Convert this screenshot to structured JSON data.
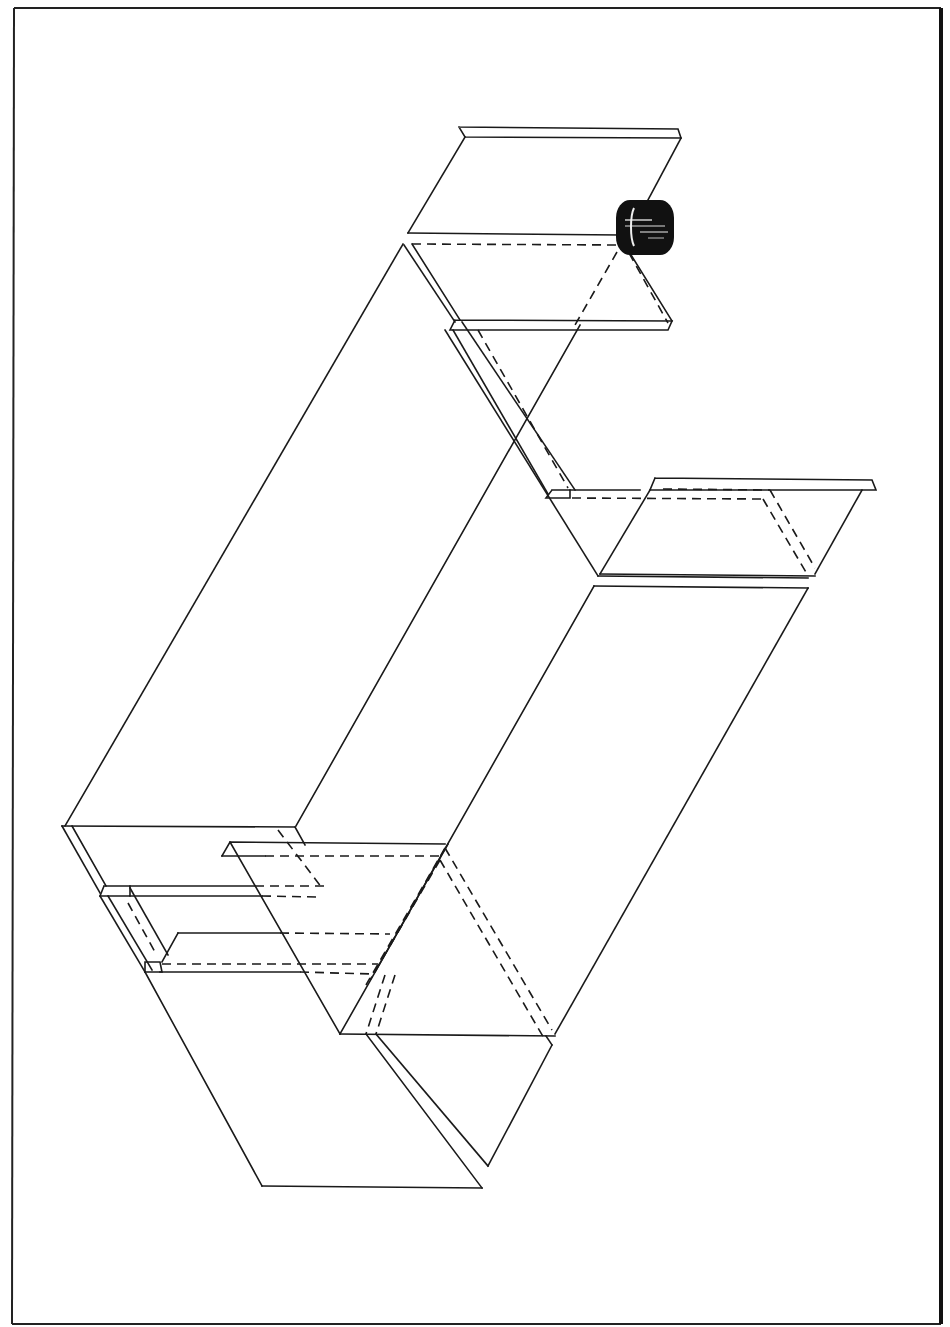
{
  "figure": {
    "type": "isometric exploded line drawing",
    "caption": "",
    "colors": {
      "line": "#1a1a1a",
      "background": "#ffffff",
      "fitting": "#111111"
    },
    "components": [
      {
        "id": "top-flanged-panel",
        "label": "Top flanged panel"
      },
      {
        "id": "cylindrical-fitting",
        "label": "Cylindrical fitting"
      },
      {
        "id": "main-box-body",
        "label": "Main box body"
      },
      {
        "id": "right-side-flanged-panel",
        "label": "Right side flanged panel"
      },
      {
        "id": "left-end-flanged-panel",
        "label": "Left end flanged panel"
      },
      {
        "id": "inner-insert-panel",
        "label": "Inner insert panel"
      },
      {
        "id": "bottom-open-panel",
        "label": "Bottom open panel"
      }
    ],
    "line_styles": {
      "visible_edges": "solid",
      "hidden_edges": "dashed"
    }
  }
}
